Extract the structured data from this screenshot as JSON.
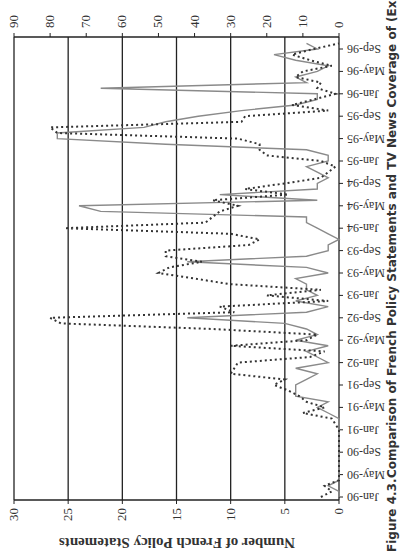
{
  "figure": {
    "caption_label": "Figure 4.3.",
    "caption_title": "Comparison of French Policy Statements and TV News Coverage of (Ex-) Yugoslavia",
    "rotation": "rotated 90 degrees clockwise on page"
  },
  "chart_data": {
    "type": "line",
    "title": "Comparison of French Policy Statements and TV News Coverage of (Ex-) Yugoslavia",
    "xlabel": "",
    "ylabel": "Number of French Policy Statements",
    "y2label": "",
    "ylim": [
      0,
      30
    ],
    "y2lim": [
      0,
      90
    ],
    "yticks": [
      0,
      5,
      10,
      15,
      20,
      25,
      30
    ],
    "y2ticks": [
      0,
      10,
      20,
      30,
      40,
      50,
      60,
      70,
      80,
      90
    ],
    "grid": true,
    "legend": "none",
    "x_tick_labels": [
      "Jan-90",
      "May-90",
      "Sep-90",
      "Jan-91",
      "May-91",
      "Sep-91",
      "Jan-92",
      "May-92",
      "Sep-92",
      "Jan-93",
      "May-93",
      "Sep-93",
      "Jan-94",
      "May-94",
      "Sep-94",
      "Jan-95",
      "May-95",
      "Sep-95",
      "Jan-96",
      "May-96",
      "Sep-96"
    ],
    "x": [
      "Jan-90",
      "Feb-90",
      "Mar-90",
      "Apr-90",
      "May-90",
      "Jun-90",
      "Jul-90",
      "Aug-90",
      "Sep-90",
      "Oct-90",
      "Nov-90",
      "Dec-90",
      "Jan-91",
      "Feb-91",
      "Mar-91",
      "Apr-91",
      "May-91",
      "Jun-91",
      "Jul-91",
      "Aug-91",
      "Sep-91",
      "Oct-91",
      "Nov-91",
      "Dec-91",
      "Jan-92",
      "Feb-92",
      "Mar-92",
      "Apr-92",
      "May-92",
      "Jun-92",
      "Jul-92",
      "Aug-92",
      "Sep-92",
      "Oct-92",
      "Nov-92",
      "Dec-92",
      "Jan-93",
      "Feb-93",
      "Mar-93",
      "Apr-93",
      "May-93",
      "Jun-93",
      "Jul-93",
      "Aug-93",
      "Sep-93",
      "Oct-93",
      "Nov-93",
      "Dec-93",
      "Jan-94",
      "Feb-94",
      "Mar-94",
      "Apr-94",
      "May-94",
      "Jun-94",
      "Jul-94",
      "Aug-94",
      "Sep-94",
      "Oct-94",
      "Nov-94",
      "Dec-94",
      "Jan-95",
      "Feb-95",
      "Mar-95",
      "Apr-95",
      "May-95",
      "Jun-95",
      "Jul-95",
      "Aug-95",
      "Sep-95",
      "Oct-95",
      "Nov-95",
      "Dec-95",
      "Jan-96",
      "Feb-96",
      "Mar-96",
      "Apr-96",
      "May-96",
      "Jun-96",
      "Jul-96",
      "Aug-96",
      "Sep-96",
      "Oct-96"
    ],
    "series": [
      {
        "name": "French Policy Statements",
        "axis": "primary (0-30)",
        "style": "solid gray",
        "color": "#8a8a8a",
        "values": [
          0,
          0,
          1,
          0,
          0,
          0,
          0,
          0,
          0,
          0,
          0,
          0,
          0,
          0,
          0,
          1,
          2,
          1,
          4,
          4,
          4,
          3,
          2,
          4,
          1,
          2,
          3,
          1,
          4,
          2,
          3,
          5,
          14,
          3,
          1,
          4,
          2,
          3,
          3,
          4,
          1,
          3,
          14,
          3,
          1,
          1,
          0,
          1,
          2,
          3,
          3,
          22,
          24,
          2,
          11,
          2,
          2,
          1,
          2,
          3,
          1,
          1,
          3,
          16,
          26,
          26,
          18,
          16,
          13,
          9,
          4,
          2,
          2,
          22,
          3,
          4,
          2,
          1,
          4,
          6,
          2,
          3
        ]
      },
      {
        "name": "TV News Coverage",
        "axis": "secondary (0-90)",
        "style": "dotted black",
        "color": "#333333",
        "values": [
          5,
          2,
          4,
          0,
          0,
          0,
          0,
          0,
          0,
          0,
          0,
          0,
          0,
          1,
          2,
          10,
          4,
          9,
          11,
          14,
          18,
          15,
          30,
          29,
          28,
          8,
          4,
          30,
          9,
          6,
          35,
          77,
          80,
          29,
          33,
          3,
          20,
          5,
          30,
          40,
          50,
          47,
          38,
          48,
          48,
          25,
          22,
          30,
          76,
          37,
          35,
          33,
          28,
          35,
          14,
          26,
          15,
          5,
          3,
          1,
          5,
          20,
          22,
          22,
          28,
          78,
          80,
          27,
          26,
          3,
          13,
          7,
          1,
          6,
          5,
          12,
          10,
          2,
          8,
          13,
          7,
          0
        ]
      }
    ]
  }
}
